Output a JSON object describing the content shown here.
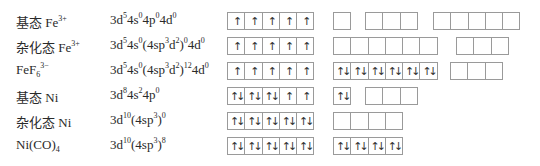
{
  "rows": [
    {
      "label": "基态 Fe",
      "label_sup": "3+",
      "label_sub": "",
      "config": [
        [
          "3d",
          "5"
        ],
        [
          "4s",
          "0"
        ],
        [
          "4p",
          "0"
        ],
        [
          "4d",
          "0"
        ]
      ],
      "config_text": "3d⁵4s⁰4p⁰4d⁰",
      "groups": [
        {
          "x": 227,
          "boxes": [
            "↑",
            "↑",
            "↑",
            "↑",
            "↑"
          ]
        },
        {
          "x": 333,
          "boxes": [
            ""
          ]
        },
        {
          "x": 365,
          "boxes": [
            "",
            "",
            ""
          ]
        },
        {
          "x": 433,
          "boxes": [
            "",
            "",
            "",
            "",
            ""
          ]
        }
      ]
    },
    {
      "label": "杂化态 Fe",
      "label_sup": "3+",
      "label_sub": "",
      "config_text": "3d⁵4s⁰(4sp³d²)⁰4d⁰",
      "groups": [
        {
          "x": 227,
          "boxes": [
            "↑",
            "↑",
            "↑",
            "↑",
            "↑"
          ]
        },
        {
          "x": 333,
          "boxes": [
            "",
            "",
            "",
            "",
            "",
            ""
          ]
        },
        {
          "x": 456,
          "boxes": [
            "",
            "",
            ""
          ]
        }
      ]
    },
    {
      "label": "FeF",
      "label_sup": "3−",
      "label_sub": "6",
      "config_text": "3d⁵4s⁰(4sp³d²)¹²4d⁰",
      "groups": [
        {
          "x": 227,
          "boxes": [
            "↑",
            "↑",
            "↑",
            "↑",
            "↑"
          ]
        },
        {
          "x": 333,
          "boxes": [
            "↑↓",
            "↑↓",
            "↑↓",
            "↑↓",
            "↑↓",
            "↑↓"
          ]
        },
        {
          "x": 450,
          "boxes": [
            "",
            "",
            ""
          ]
        }
      ]
    },
    {
      "label": "基态 Ni",
      "label_sup": "",
      "label_sub": "",
      "config_text": "3d⁸4s²4p⁰",
      "groups": [
        {
          "x": 227,
          "boxes": [
            "↑↓",
            "↑↓",
            "↑↓",
            "↑",
            "↑"
          ]
        },
        {
          "x": 333,
          "boxes": [
            "↑↓"
          ]
        },
        {
          "x": 365,
          "boxes": [
            "",
            "",
            ""
          ]
        }
      ]
    },
    {
      "label": "杂化态 Ni",
      "label_sup": "",
      "label_sub": "",
      "config_text": "3d¹⁰(4sp³)⁰",
      "groups": [
        {
          "x": 227,
          "boxes": [
            "↑↓",
            "↑↓",
            "↑↓",
            "↑↓",
            "↑↓"
          ]
        },
        {
          "x": 333,
          "boxes": [
            "",
            "",
            "",
            ""
          ]
        }
      ]
    },
    {
      "label": "Ni(CO)",
      "label_sup": "",
      "label_sub": "4",
      "config_text": "3d¹⁰(4sp³)⁸",
      "groups": [
        {
          "x": 227,
          "boxes": [
            "↑↓",
            "↑↓",
            "↑↓",
            "↑↓",
            "↑↓"
          ]
        },
        {
          "x": 333,
          "boxes": [
            "↑↓",
            "↑↓",
            "↑↓",
            "↑↓"
          ]
        }
      ]
    }
  ],
  "config_parts": [
    [
      [
        "3d",
        "5"
      ],
      [
        "4s",
        "0"
      ],
      [
        "4p",
        "0"
      ],
      [
        "4d",
        "0"
      ]
    ],
    [
      [
        "3d",
        "5"
      ],
      [
        "4s",
        "0"
      ],
      [
        "(4sp",
        "3"
      ],
      [
        "d",
        "2"
      ],
      [
        ")",
        "0"
      ],
      [
        "4d",
        "0"
      ]
    ],
    [
      [
        "3d",
        "5"
      ],
      [
        "4s",
        "0"
      ],
      [
        "(4sp",
        "3"
      ],
      [
        "d",
        "2"
      ],
      [
        ")",
        "12"
      ],
      [
        "4d",
        "0"
      ]
    ],
    [
      [
        "3d",
        "8"
      ],
      [
        "4s",
        "2"
      ],
      [
        "4p",
        "0"
      ]
    ],
    [
      [
        "3d",
        "10"
      ],
      [
        "(4sp",
        "3"
      ],
      [
        ")",
        "0"
      ]
    ],
    [
      [
        "3d",
        "10"
      ],
      [
        "(4sp",
        "3"
      ],
      [
        ")",
        "8"
      ]
    ]
  ]
}
